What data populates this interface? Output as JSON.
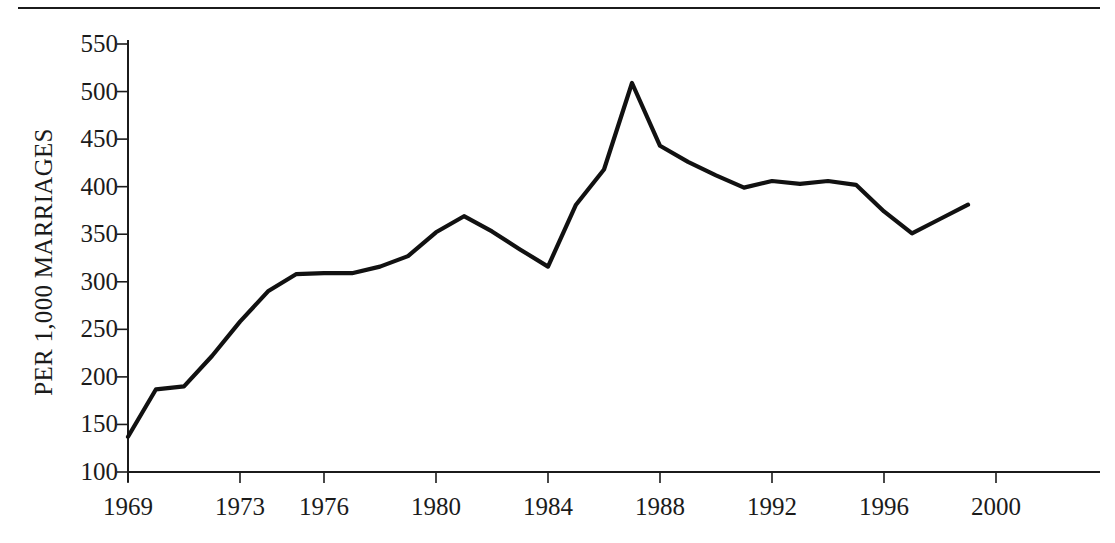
{
  "figure": {
    "background_color": "#ffffff",
    "line_color": "#111111",
    "axis_color": "#1b1b1b",
    "top_rule": "divider-rule"
  },
  "chart_data": {
    "type": "line",
    "title": "",
    "xlabel": "",
    "ylabel": "PER 1,000 MARRIAGES",
    "xlim": [
      1969,
      2000
    ],
    "ylim": [
      100,
      550
    ],
    "grid": false,
    "legend": null,
    "y_ticks": [
      550,
      500,
      450,
      400,
      350,
      300,
      250,
      200,
      150,
      100
    ],
    "y_tick_labels": [
      "550",
      "500",
      "450",
      "400",
      "350",
      "300",
      "250",
      "200",
      "150",
      "100"
    ],
    "x_ticks": [
      1969,
      1973,
      1976,
      1980,
      1984,
      1988,
      1992,
      1996,
      2000
    ],
    "x_tick_labels": [
      "1969",
      "1973",
      "1976",
      "1980",
      "1984",
      "1988",
      "1992",
      "1996",
      "2000"
    ],
    "x": [
      1969,
      1970,
      1971,
      1972,
      1973,
      1974,
      1975,
      1976,
      1977,
      1978,
      1979,
      1980,
      1981,
      1982,
      1983,
      1984,
      1985,
      1986,
      1987,
      1988,
      1989,
      1990,
      1991,
      1992,
      1993,
      1994,
      1995,
      1996,
      1997,
      1998,
      1999
    ],
    "values": [
      137,
      187,
      190,
      222,
      258,
      290,
      308,
      309,
      309,
      316,
      327,
      352,
      369,
      353,
      334,
      316,
      381,
      418,
      509,
      443,
      426,
      412,
      399,
      406,
      403,
      406,
      402,
      374,
      351,
      366,
      381
    ],
    "series": [
      {
        "name": "Divorces per 1,000 marriages",
        "values": [
          137,
          187,
          190,
          222,
          258,
          290,
          308,
          309,
          309,
          316,
          327,
          352,
          369,
          353,
          334,
          316,
          381,
          418,
          509,
          443,
          426,
          412,
          399,
          406,
          403,
          406,
          402,
          374,
          351,
          366,
          381
        ]
      }
    ],
    "peak": {
      "x": 1987,
      "y": 509
    },
    "minimum": {
      "x": 1969,
      "y": 137
    }
  }
}
